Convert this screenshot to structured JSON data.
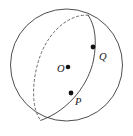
{
  "figure": {
    "kind": "geometry-diagram",
    "background_color": "#ffffff",
    "stroke_color": "#3a3a3a",
    "point_color": "#121212",
    "label_color": "#161616"
  },
  "sphere": {
    "name": "sphere-outline",
    "center_x": 66.5,
    "center_y": 65,
    "radius": 56,
    "stroke_width": 0.9
  },
  "great_circle": {
    "name": "great-circle",
    "center_x": 66.5,
    "center_y": 65,
    "radius_x": 56,
    "radius_y": 21,
    "rotation_deg": -65,
    "front_arc_style": "solid",
    "back_arc_style": "dashed",
    "dash_pattern": "2.2 2.6",
    "stroke_width": 0.9
  },
  "points": [
    {
      "id": "O",
      "label": "O",
      "x": 68,
      "y": 67,
      "radius": 2.3,
      "role": "center-of-sphere"
    },
    {
      "id": "P",
      "label": "P",
      "x": 71,
      "y": 93,
      "radius": 2.4,
      "role": "point-on-great-circle"
    },
    {
      "id": "Q",
      "label": "Q",
      "x": 93,
      "y": 47,
      "radius": 2.4,
      "role": "point-on-great-circle"
    }
  ],
  "labels": {
    "center": "O",
    "lower_point": "P",
    "upper_point": "Q"
  }
}
